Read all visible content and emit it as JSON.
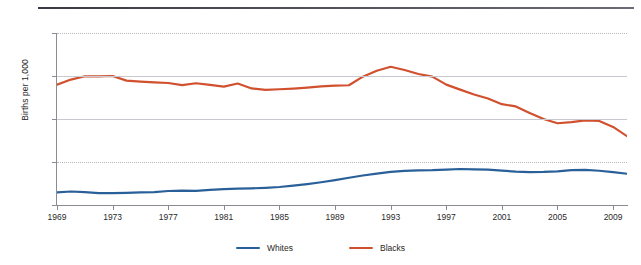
{
  "chart_data": {
    "type": "line",
    "title": "",
    "xlabel": "",
    "ylabel": "Births per 1,000",
    "ylim": [
      0,
      130
    ],
    "xlim": [
      1969,
      2010
    ],
    "yticks": [
      "0",
      "32.5",
      "65",
      "97.5",
      "130"
    ],
    "ytick_values": [
      0,
      32.5,
      65,
      97.5,
      130
    ],
    "xticks": [
      "1969",
      "1973",
      "1977",
      "1981",
      "1985",
      "1989",
      "1993",
      "1997",
      "2001",
      "2005",
      "2009"
    ],
    "xtick_values": [
      1969,
      1973,
      1977,
      1981,
      1985,
      1989,
      1993,
      1997,
      2001,
      2005,
      2009
    ],
    "grid": true,
    "legend_position": "bottom",
    "x": [
      1969,
      1970,
      1971,
      1972,
      1973,
      1974,
      1975,
      1976,
      1977,
      1978,
      1979,
      1980,
      1981,
      1982,
      1983,
      1984,
      1985,
      1986,
      1987,
      1988,
      1989,
      1990,
      1991,
      1992,
      1993,
      1994,
      1995,
      1996,
      1997,
      1998,
      1999,
      2000,
      2001,
      2002,
      2003,
      2004,
      2005,
      2006,
      2007,
      2008,
      2009,
      2010
    ],
    "series": [
      {
        "name": "Whites",
        "color": "#2a6099",
        "values": [
          9.5,
          10.2,
          9.8,
          9.0,
          9.0,
          9.2,
          9.5,
          9.8,
          10.6,
          10.8,
          10.7,
          11.5,
          12.0,
          12.4,
          12.6,
          13.0,
          13.6,
          14.6,
          15.8,
          17.2,
          18.8,
          20.6,
          22.3,
          23.7,
          25.0,
          25.8,
          26.1,
          26.3,
          26.8,
          27.2,
          27.0,
          26.8,
          26.0,
          25.2,
          24.9,
          25.0,
          25.4,
          26.3,
          26.5,
          25.9,
          24.9,
          23.6
        ]
      },
      {
        "name": "Blacks",
        "color": "#d1502e",
        "values": [
          91.0,
          94.8,
          97.3,
          97.2,
          97.5,
          94.0,
          93.3,
          92.7,
          92.2,
          90.6,
          92.0,
          90.8,
          89.5,
          91.8,
          88.1,
          87.0,
          87.5,
          88.0,
          88.7,
          89.6,
          90.2,
          90.5,
          97.0,
          101.5,
          104.5,
          102.0,
          99.0,
          97.0,
          91.0,
          87.2,
          83.5,
          80.5,
          76.2,
          74.5,
          69.5,
          65.0,
          61.8,
          62.6,
          64.0,
          63.5,
          59.0,
          52.0
        ]
      }
    ]
  },
  "legend": {
    "items": [
      {
        "label": "Whites",
        "color": "#2a6099"
      },
      {
        "label": "Blacks",
        "color": "#d1502e"
      }
    ]
  }
}
